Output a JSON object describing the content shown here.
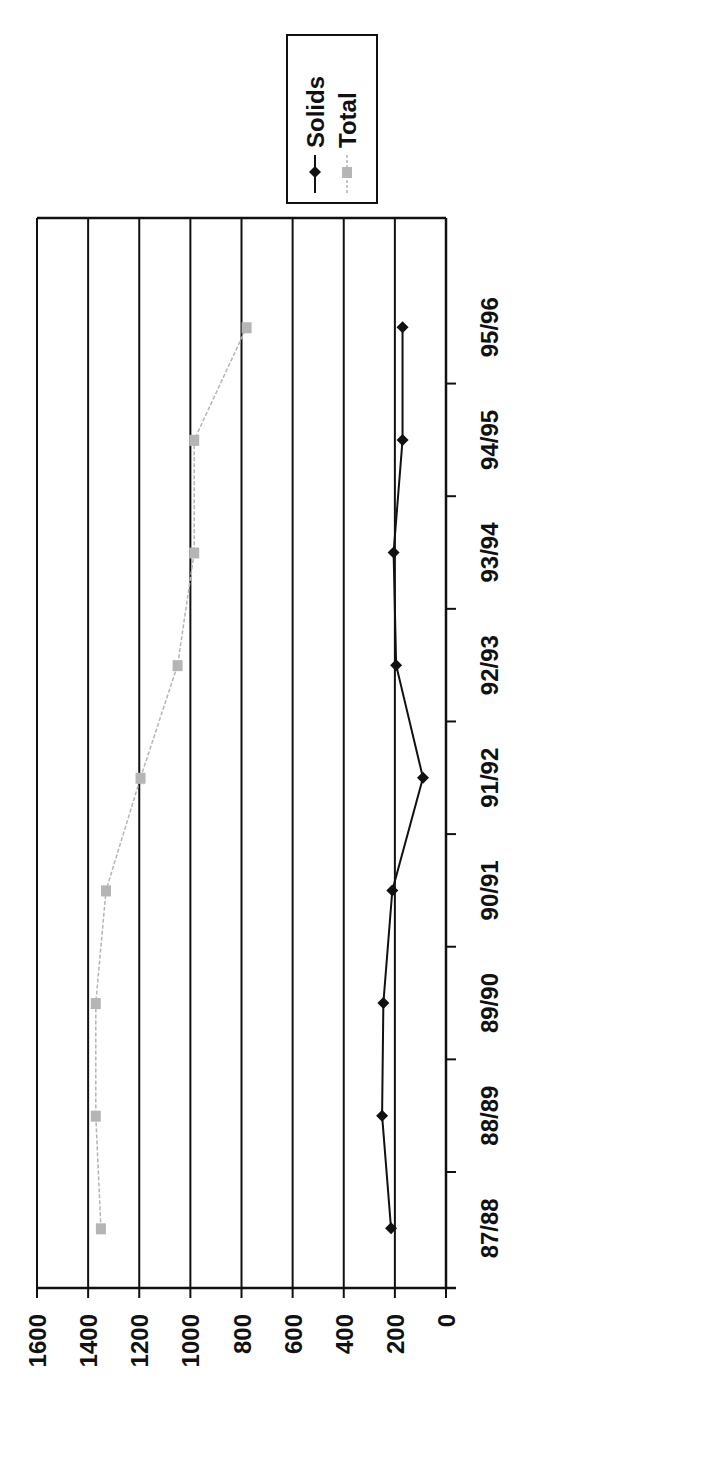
{
  "chart_data": {
    "type": "line",
    "orientation": "rotated 90deg clockwise (value axis horizontal, categories vertical)",
    "title": "",
    "xlabel": "",
    "ylabel": "",
    "categories": [
      "87/88",
      "88/89",
      "89/90",
      "90/91",
      "91/92",
      "92/93",
      "93/94",
      "94/95",
      "95/96"
    ],
    "series": [
      {
        "name": "Solids",
        "color": "#111111",
        "marker": "diamond",
        "values": [
          215,
          250,
          245,
          210,
          90,
          195,
          205,
          170,
          170
        ]
      },
      {
        "name": "Total",
        "color": "#b5b5b5",
        "marker": "square",
        "values": [
          1350,
          1370,
          1370,
          1330,
          1195,
          1050,
          985,
          985,
          780
        ]
      }
    ],
    "value_axis": {
      "min": 0,
      "max": 1600,
      "step": 200,
      "ticks": [
        "0",
        "200",
        "400",
        "600",
        "800",
        "1000",
        "1200",
        "1400",
        "1600"
      ]
    },
    "grid": true,
    "legend": {
      "position": "top",
      "entries": [
        "Solids",
        "Total"
      ]
    }
  }
}
